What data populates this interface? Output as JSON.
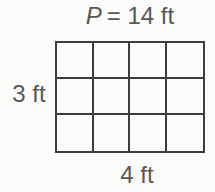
{
  "figure": {
    "perimeter": {
      "symbol": "P",
      "rest": "= 14 ft"
    },
    "height_label": "3 ft",
    "width_label": "4 ft",
    "grid": {
      "rows": 3,
      "cols": 4
    },
    "colors": {
      "line": "#3d3d3d",
      "text": "#585858",
      "background": "#fbfbfa"
    }
  }
}
